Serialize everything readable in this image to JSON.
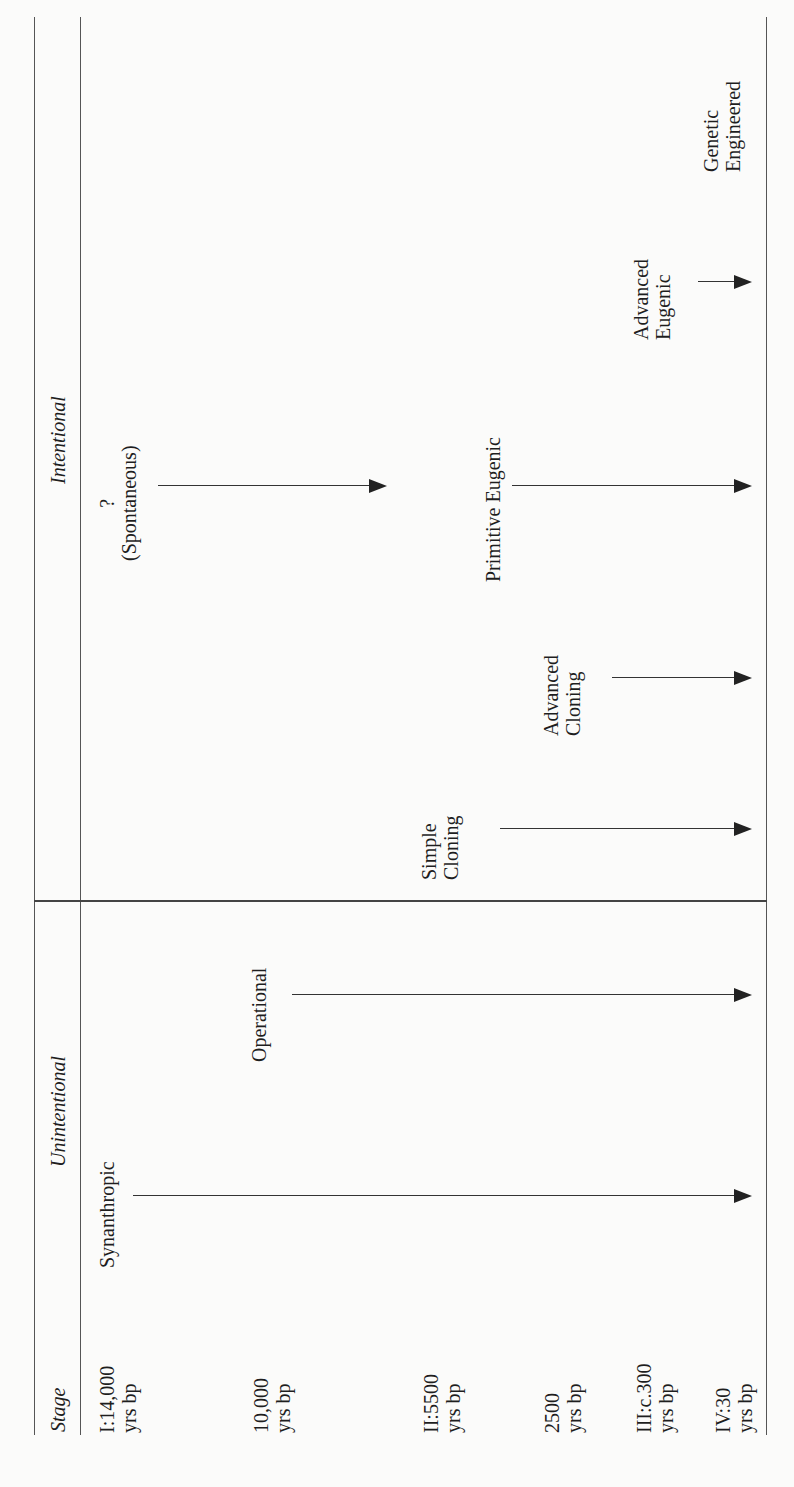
{
  "table": {
    "orientation": "rotated-90-ccw",
    "header_column": {
      "stage_label": "Stage",
      "unintentional_label": "Unintentional",
      "intentional_label": "Intentional"
    },
    "stages": [
      {
        "line1": "I:14,000",
        "line2": "yrs bp"
      },
      {
        "line1": "10,000",
        "line2": "yrs bp"
      },
      {
        "line1": "II:5500",
        "line2": "yrs bp"
      },
      {
        "line1": "2500",
        "line2": "yrs bp"
      },
      {
        "line1": "III:c.300",
        "line2": "yrs bp"
      },
      {
        "line1": "IV:30",
        "line2": "yrs bp"
      }
    ],
    "unintentional": [
      {
        "label": "Synanthropic",
        "starts_at_stage": "I:14,000 yrs bp"
      },
      {
        "label": "Operational",
        "starts_at_stage": "10,000 yrs bp"
      }
    ],
    "intentional": [
      {
        "label_line1": "Simple",
        "label_line2": "Cloning",
        "starts_at_stage": "II:5500 yrs bp"
      },
      {
        "label_line1": "Advanced",
        "label_line2": "Cloning",
        "starts_at_stage": "2500 yrs bp"
      },
      {
        "label_line1": "?",
        "label_line2": "(Spontaneous)",
        "starts_at_stage": "I:14,000 yrs bp"
      },
      {
        "label": "Primitive Eugenic",
        "starts_at_stage": "II:5500 yrs bp"
      },
      {
        "label_line1": "Advanced",
        "label_line2": "Eugenic",
        "starts_at_stage": "III:c.300 yrs bp"
      },
      {
        "label_line1": "Genetic",
        "label_line2": "Engineered",
        "starts_at_stage": "IV:30 yrs bp"
      }
    ]
  },
  "colors": {
    "paper": "#fbfbfa",
    "ink": "#1e1e1e",
    "rule": "#555555"
  }
}
